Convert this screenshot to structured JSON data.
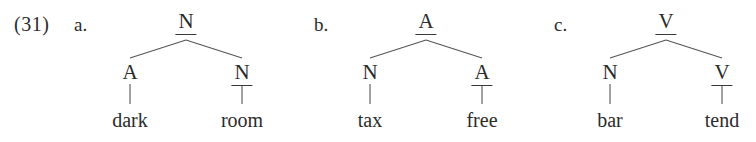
{
  "figure": {
    "example_number": "(31)",
    "line_color": "#555555",
    "text_color": "#2b2b2b"
  },
  "trees": [
    {
      "label": "a.",
      "root": {
        "category": "N",
        "is_head_underlined": true
      },
      "left_child": {
        "category": "A",
        "is_head_underlined": false,
        "word": "dark"
      },
      "right_child": {
        "category": "N",
        "is_head_underlined": true,
        "word": "room"
      }
    },
    {
      "label": "b.",
      "root": {
        "category": "A",
        "is_head_underlined": true
      },
      "left_child": {
        "category": "N",
        "is_head_underlined": false,
        "word": "tax"
      },
      "right_child": {
        "category": "A",
        "is_head_underlined": true,
        "word": "free"
      }
    },
    {
      "label": "c.",
      "root": {
        "category": "V",
        "is_head_underlined": true
      },
      "left_child": {
        "category": "N",
        "is_head_underlined": false,
        "word": "bar"
      },
      "right_child": {
        "category": "V",
        "is_head_underlined": true,
        "word": "tend"
      }
    }
  ]
}
